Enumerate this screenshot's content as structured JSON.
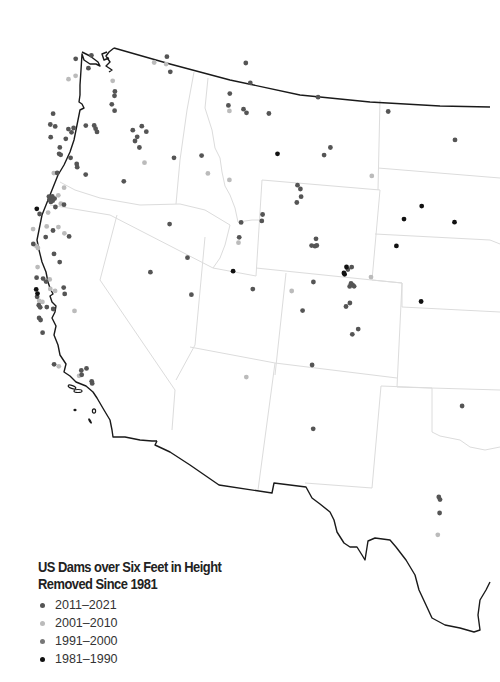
{
  "legend": {
    "title_line1": "US Dams over Six Feet in Height",
    "title_line2": "Removed Since 1981",
    "items": [
      {
        "key": "p2011",
        "label": "2011–2021",
        "color": "#555555"
      },
      {
        "key": "p2001",
        "label": "2001–2010",
        "color": "#bbbbbb"
      },
      {
        "key": "p1991",
        "label": "1991–2000",
        "color": "#777777"
      },
      {
        "key": "p1981",
        "label": "1981–1990",
        "color": "#111111"
      }
    ]
  },
  "dams": [
    {
      "lon": -122.6,
      "lat": 48.75,
      "p": "p2011"
    },
    {
      "lon": -121.7,
      "lat": 48.9,
      "p": "p2011"
    },
    {
      "lon": -121.8,
      "lat": 48.3,
      "p": "p2011"
    },
    {
      "lon": -122.9,
      "lat": 47.8,
      "p": "p2001"
    },
    {
      "lon": -122.5,
      "lat": 47.95,
      "p": "p2001"
    },
    {
      "lon": -120.3,
      "lat": 47.7,
      "p": "p2001"
    },
    {
      "lon": -120.1,
      "lat": 47.2,
      "p": "p2011"
    },
    {
      "lon": -120.1,
      "lat": 47.0,
      "p": "p2011"
    },
    {
      "lon": -120.2,
      "lat": 46.6,
      "p": "p2011"
    },
    {
      "lon": -120.0,
      "lat": 46.3,
      "p": "p2011"
    },
    {
      "lon": -118.0,
      "lat": 48.6,
      "p": "p2001"
    },
    {
      "lon": -117.3,
      "lat": 48.9,
      "p": "p2011"
    },
    {
      "lon": -117.3,
      "lat": 48.55,
      "p": "p2001"
    },
    {
      "lon": -117.0,
      "lat": 48.2,
      "p": "p2011"
    },
    {
      "lon": -123.6,
      "lat": 46.2,
      "p": "p2011"
    },
    {
      "lon": -123.4,
      "lat": 45.6,
      "p": "p2011"
    },
    {
      "lon": -122.6,
      "lat": 45.45,
      "p": "p2011"
    },
    {
      "lon": -122.4,
      "lat": 45.3,
      "p": "p2011"
    },
    {
      "lon": -122.3,
      "lat": 45.5,
      "p": "p2011"
    },
    {
      "lon": -122.7,
      "lat": 45.0,
      "p": "p2011"
    },
    {
      "lon": -121.6,
      "lat": 45.6,
      "p": "p2011"
    },
    {
      "lon": -121.1,
      "lat": 45.6,
      "p": "p2011"
    },
    {
      "lon": -120.9,
      "lat": 45.3,
      "p": "p2011"
    },
    {
      "lon": -121.0,
      "lat": 45.45,
      "p": "p2011"
    },
    {
      "lon": -123.7,
      "lat": 45.7,
      "p": "p2011"
    },
    {
      "lon": -123.6,
      "lat": 45.1,
      "p": "p2011"
    },
    {
      "lon": -123.0,
      "lat": 44.6,
      "p": "p2011"
    },
    {
      "lon": -123.0,
      "lat": 44.3,
      "p": "p2011"
    },
    {
      "lon": -122.9,
      "lat": 44.25,
      "p": "p2011"
    },
    {
      "lon": -122.3,
      "lat": 44.1,
      "p": "p2011"
    },
    {
      "lon": -121.9,
      "lat": 43.8,
      "p": "p2011"
    },
    {
      "lon": -121.85,
      "lat": 43.65,
      "p": "p2011"
    },
    {
      "lon": -121.3,
      "lat": 43.3,
      "p": "p2011"
    },
    {
      "lon": -118.8,
      "lat": 45.4,
      "p": "p2011"
    },
    {
      "lon": -118.3,
      "lat": 45.6,
      "p": "p2011"
    },
    {
      "lon": -118.0,
      "lat": 45.35,
      "p": "p2011"
    },
    {
      "lon": -118.5,
      "lat": 45.1,
      "p": "p2011"
    },
    {
      "lon": -118.6,
      "lat": 44.9,
      "p": "p2011"
    },
    {
      "lon": -118.3,
      "lat": 44.6,
      "p": "p2011"
    },
    {
      "lon": -117.9,
      "lat": 43.9,
      "p": "p2001"
    },
    {
      "lon": -119.0,
      "lat": 43.0,
      "p": "p2011"
    },
    {
      "lon": -123.2,
      "lat": 43.4,
      "p": "p2001"
    },
    {
      "lon": -123.0,
      "lat": 43.4,
      "p": "p2011"
    },
    {
      "lon": -122.5,
      "lat": 42.7,
      "p": "p2001"
    },
    {
      "lon": -123.35,
      "lat": 42.3,
      "p": "p2011"
    },
    {
      "lon": -123.25,
      "lat": 42.25,
      "p": "p2011"
    },
    {
      "lon": -123.15,
      "lat": 42.3,
      "p": "p2011"
    },
    {
      "lon": -123.3,
      "lat": 42.15,
      "p": "p2011"
    },
    {
      "lon": -123.1,
      "lat": 42.1,
      "p": "p2011"
    },
    {
      "lon": -123.2,
      "lat": 42.05,
      "p": "p2011"
    },
    {
      "lon": -123.0,
      "lat": 42.2,
      "p": "p2011"
    },
    {
      "lon": -122.8,
      "lat": 42.35,
      "p": "p2001"
    },
    {
      "lon": -122.6,
      "lat": 41.95,
      "p": "p2001"
    },
    {
      "lon": -122.4,
      "lat": 41.9,
      "p": "p2011"
    },
    {
      "lon": -124.0,
      "lat": 41.75,
      "p": "p1981"
    },
    {
      "lon": -123.8,
      "lat": 41.5,
      "p": "p2011"
    },
    {
      "lon": -122.9,
      "lat": 41.8,
      "p": "p2011"
    },
    {
      "lon": -123.3,
      "lat": 41.55,
      "p": "p2001"
    },
    {
      "lon": -124.1,
      "lat": 40.8,
      "p": "p2001"
    },
    {
      "lon": -123.3,
      "lat": 40.9,
      "p": "p2001"
    },
    {
      "lon": -122.9,
      "lat": 40.7,
      "p": "p2011"
    },
    {
      "lon": -122.6,
      "lat": 40.85,
      "p": "p2001"
    },
    {
      "lon": -123.3,
      "lat": 40.4,
      "p": "p2011"
    },
    {
      "lon": -122.2,
      "lat": 40.55,
      "p": "p2001"
    },
    {
      "lon": -121.9,
      "lat": 40.4,
      "p": "p2011"
    },
    {
      "lon": -124.0,
      "lat": 40.1,
      "p": "p2011"
    },
    {
      "lon": -123.8,
      "lat": 40.0,
      "p": "p2001"
    },
    {
      "lon": -123.7,
      "lat": 39.9,
      "p": "p2001"
    },
    {
      "lon": -122.7,
      "lat": 39.6,
      "p": "p2011"
    },
    {
      "lon": -122.3,
      "lat": 39.2,
      "p": "p2011"
    },
    {
      "lon": -123.6,
      "lat": 39.0,
      "p": "p2001"
    },
    {
      "lon": -123.6,
      "lat": 38.5,
      "p": "p2011"
    },
    {
      "lon": -123.2,
      "lat": 38.45,
      "p": "p2011"
    },
    {
      "lon": -123.0,
      "lat": 38.3,
      "p": "p2011"
    },
    {
      "lon": -122.8,
      "lat": 38.4,
      "p": "p2001"
    },
    {
      "lon": -122.7,
      "lat": 37.95,
      "p": "p2001"
    },
    {
      "lon": -122.4,
      "lat": 37.85,
      "p": "p2001"
    },
    {
      "lon": -121.9,
      "lat": 38.0,
      "p": "p2011"
    },
    {
      "lon": -121.8,
      "lat": 37.7,
      "p": "p2011"
    },
    {
      "lon": -123.55,
      "lat": 37.95,
      "p": "p1981"
    },
    {
      "lon": -123.45,
      "lat": 37.75,
      "p": "p1981"
    },
    {
      "lon": -123.45,
      "lat": 37.6,
      "p": "p2011"
    },
    {
      "lon": -123.3,
      "lat": 37.4,
      "p": "p2001"
    },
    {
      "lon": -123.1,
      "lat": 37.35,
      "p": "p2001"
    },
    {
      "lon": -123.3,
      "lat": 37.2,
      "p": "p2011"
    },
    {
      "lon": -123.2,
      "lat": 37.1,
      "p": "p2011"
    },
    {
      "lon": -122.8,
      "lat": 37.1,
      "p": "p2011"
    },
    {
      "lon": -122.4,
      "lat": 37.0,
      "p": "p2011"
    },
    {
      "lon": -121.1,
      "lat": 36.9,
      "p": "p2001"
    },
    {
      "lon": -123.2,
      "lat": 36.6,
      "p": "p2011"
    },
    {
      "lon": -123.1,
      "lat": 36.5,
      "p": "p2011"
    },
    {
      "lon": -122.9,
      "lat": 35.9,
      "p": "p2011"
    },
    {
      "lon": -122.0,
      "lat": 34.4,
      "p": "p2011"
    },
    {
      "lon": -121.7,
      "lat": 34.3,
      "p": "p2001"
    },
    {
      "lon": -120.4,
      "lat": 33.85,
      "p": "p2001"
    },
    {
      "lon": -120.3,
      "lat": 34.1,
      "p": "p2011"
    },
    {
      "lon": -120.25,
      "lat": 33.9,
      "p": "p2011"
    },
    {
      "lon": -120.0,
      "lat": 34.2,
      "p": "p2011"
    },
    {
      "lon": -119.6,
      "lat": 33.6,
      "p": "p2011"
    },
    {
      "lon": -119.55,
      "lat": 33.5,
      "p": "p2011"
    },
    {
      "lon": -116.0,
      "lat": 41.1,
      "p": "p2011"
    },
    {
      "lon": -114.7,
      "lat": 39.6,
      "p": "p2011"
    },
    {
      "lon": -114.2,
      "lat": 37.9,
      "p": "p2011"
    },
    {
      "lon": -116.8,
      "lat": 38.8,
      "p": "p2011"
    },
    {
      "lon": -116.2,
      "lat": 44.2,
      "p": "p2011"
    },
    {
      "lon": -114.6,
      "lat": 44.4,
      "p": "p2011"
    },
    {
      "lon": -114.1,
      "lat": 43.6,
      "p": "p2001"
    },
    {
      "lon": -113.4,
      "lat": 47.4,
      "p": "p2011"
    },
    {
      "lon": -112.7,
      "lat": 48.9,
      "p": "p2011"
    },
    {
      "lon": -112.3,
      "lat": 48.0,
      "p": "p2011"
    },
    {
      "lon": -113.4,
      "lat": 46.85,
      "p": "p2011"
    },
    {
      "lon": -113.3,
      "lat": 46.6,
      "p": "p2001"
    },
    {
      "lon": -112.5,
      "lat": 46.75,
      "p": "p2011"
    },
    {
      "lon": -112.3,
      "lat": 46.6,
      "p": "p2011"
    },
    {
      "lon": -111.0,
      "lat": 46.7,
      "p": "p2011"
    },
    {
      "lon": -108.3,
      "lat": 47.8,
      "p": "p2011"
    },
    {
      "lon": -110.2,
      "lat": 44.9,
      "p": "p1981"
    },
    {
      "lon": -107.2,
      "lat": 45.6,
      "p": "p2011"
    },
    {
      "lon": -107.5,
      "lat": 45.2,
      "p": "p2011"
    },
    {
      "lon": -104.6,
      "lat": 44.7,
      "p": "p2001"
    },
    {
      "lon": -104.2,
      "lat": 47.8,
      "p": "p2011"
    },
    {
      "lon": -100.2,
      "lat": 47.3,
      "p": "p2011"
    },
    {
      "lon": -112.8,
      "lat": 43.4,
      "p": "p2001"
    },
    {
      "lon": -108.8,
      "lat": 43.6,
      "p": "p2011"
    },
    {
      "lon": -108.6,
      "lat": 43.45,
      "p": "p2011"
    },
    {
      "lon": -108.5,
      "lat": 43.1,
      "p": "p2011"
    },
    {
      "lon": -108.7,
      "lat": 42.8,
      "p": "p2011"
    },
    {
      "lon": -110.6,
      "lat": 42.0,
      "p": "p2011"
    },
    {
      "lon": -110.6,
      "lat": 41.7,
      "p": "p2011"
    },
    {
      "lon": -111.8,
      "lat": 41.5,
      "p": "p2011"
    },
    {
      "lon": -111.8,
      "lat": 40.8,
      "p": "p2011"
    },
    {
      "lon": -111.8,
      "lat": 40.55,
      "p": "p2001"
    },
    {
      "lon": -111.9,
      "lat": 39.2,
      "p": "p1981"
    },
    {
      "lon": -110.6,
      "lat": 38.5,
      "p": "p2011"
    },
    {
      "lon": -107.3,
      "lat": 41.3,
      "p": "p2011"
    },
    {
      "lon": -107.5,
      "lat": 40.95,
      "p": "p2011"
    },
    {
      "lon": -107.3,
      "lat": 40.95,
      "p": "p2011"
    },
    {
      "lon": -107.2,
      "lat": 41.0,
      "p": "p2011"
    },
    {
      "lon": -105.3,
      "lat": 40.3,
      "p": "p1981"
    },
    {
      "lon": -105.0,
      "lat": 40.35,
      "p": "p2011"
    },
    {
      "lon": -105.2,
      "lat": 40.2,
      "p": "p2011"
    },
    {
      "lon": -105.4,
      "lat": 40.0,
      "p": "p1981"
    },
    {
      "lon": -105.35,
      "lat": 39.95,
      "p": "p1981"
    },
    {
      "lon": -103.8,
      "lat": 40.1,
      "p": "p2001"
    },
    {
      "lon": -104.9,
      "lat": 39.6,
      "p": "p2011"
    },
    {
      "lon": -104.8,
      "lat": 39.55,
      "p": "p2011"
    },
    {
      "lon": -104.95,
      "lat": 39.45,
      "p": "p2011"
    },
    {
      "lon": -104.7,
      "lat": 39.5,
      "p": "p2011"
    },
    {
      "lon": -107.1,
      "lat": 39.3,
      "p": "p2011"
    },
    {
      "lon": -108.3,
      "lat": 38.7,
      "p": "p2001"
    },
    {
      "lon": -105.0,
      "lat": 38.5,
      "p": "p2011"
    },
    {
      "lon": -104.8,
      "lat": 38.7,
      "p": "p2011"
    },
    {
      "lon": -107.5,
      "lat": 37.9,
      "p": "p2011"
    },
    {
      "lon": -104.1,
      "lat": 37.6,
      "p": "p2011"
    },
    {
      "lon": -104.4,
      "lat": 37.3,
      "p": "p2011"
    },
    {
      "lon": -101.5,
      "lat": 43.9,
      "p": "p1981"
    },
    {
      "lon": -99.5,
      "lat": 43.6,
      "p": "p1981"
    },
    {
      "lon": -102.4,
      "lat": 43.1,
      "p": "p1981"
    },
    {
      "lon": -102.6,
      "lat": 41.8,
      "p": "p1981"
    },
    {
      "lon": -100.7,
      "lat": 39.6,
      "p": "p1981"
    },
    {
      "lon": -97.4,
      "lat": 35.5,
      "p": "p2011"
    },
    {
      "lon": -110.3,
      "lat": 34.4,
      "p": "p2001"
    },
    {
      "lon": -106.5,
      "lat": 35.5,
      "p": "p2011"
    },
    {
      "lon": -105.9,
      "lat": 32.6,
      "p": "p2011"
    },
    {
      "lon": -97.9,
      "lat": 31.1,
      "p": "p2011"
    },
    {
      "lon": -97.8,
      "lat": 31.0,
      "p": "p2011"
    },
    {
      "lon": -97.7,
      "lat": 30.4,
      "p": "p2011"
    },
    {
      "lon": -97.6,
      "lat": 29.4,
      "p": "p2001"
    }
  ]
}
